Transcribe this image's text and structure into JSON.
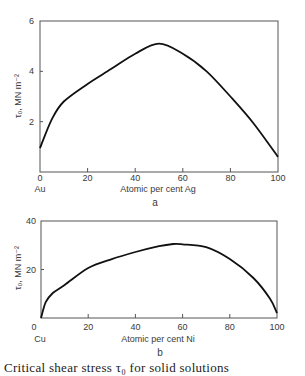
{
  "chart_data": [
    {
      "type": "line",
      "panel_label": "a",
      "title": "",
      "xlabel": "Atomic per cent Ag",
      "x_origin_label": "Au",
      "ylabel": "τ₀, MN m⁻²",
      "xlim": [
        0,
        100
      ],
      "ylim": [
        0,
        6
      ],
      "x_ticks": [
        0,
        20,
        40,
        60,
        80,
        100
      ],
      "x_tick_labels": [
        "0",
        "20",
        "40",
        "60",
        "80",
        "100"
      ],
      "y_ticks": [
        2,
        4,
        6
      ],
      "y_tick_labels": [
        "2",
        "4",
        "6"
      ],
      "grid": false,
      "legend": null,
      "series": [
        {
          "name": "Au-Ag",
          "x": [
            0,
            5,
            10,
            20,
            30,
            40,
            50,
            60,
            70,
            80,
            90,
            100
          ],
          "values": [
            0.95,
            2.1,
            2.8,
            3.5,
            4.1,
            4.7,
            5.1,
            4.7,
            4.0,
            3.0,
            1.9,
            0.6
          ]
        }
      ]
    },
    {
      "type": "line",
      "panel_label": "b",
      "title": "",
      "xlabel": "Atomic per cent Ni",
      "x_origin_label": "Cu",
      "ylabel": "τ₀, MN m⁻²",
      "xlim": [
        0,
        100
      ],
      "ylim": [
        0,
        40
      ],
      "x_ticks": [
        0,
        20,
        40,
        60,
        80,
        100
      ],
      "x_tick_labels": [
        "0",
        "20",
        "40",
        "60",
        "80",
        "100"
      ],
      "y_ticks": [
        20,
        40
      ],
      "y_tick_labels": [
        "20",
        "40"
      ],
      "grid": false,
      "legend": null,
      "series": [
        {
          "name": "Cu-Ni",
          "x": [
            0,
            2,
            5,
            10,
            20,
            30,
            40,
            50,
            56,
            60,
            70,
            80,
            90,
            97,
            100
          ],
          "values": [
            0,
            6.5,
            10.3,
            13.6,
            20.6,
            24.3,
            27.2,
            29.6,
            30.5,
            30.4,
            29.2,
            24.3,
            16.5,
            8,
            2
          ]
        }
      ]
    }
  ],
  "caption_partial": "Critical shear stress τ₀ for solid solutions"
}
